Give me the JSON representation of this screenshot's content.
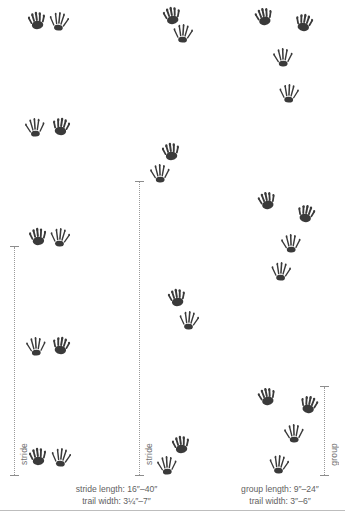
{
  "figure": {
    "background": "#ffffff",
    "ink_color": "#3a3a3a",
    "rule_color": "#9a9a9a",
    "text_color": "#5f5f5f"
  },
  "patterns": [
    {
      "id": "left-walk",
      "measure_label": "stride",
      "caption_lines": [
        "stride length: 16″–40″",
        "trail width: 3¼″–7″"
      ],
      "measure": {
        "x": 10,
        "top": 243,
        "bottom": 479
      },
      "caption": {
        "x": 44,
        "y": 483,
        "width": 145
      },
      "tracks": [
        {
          "name": "track-front",
          "type": "front",
          "x": 26,
          "y": 10,
          "rot": -8,
          "size": 22
        },
        {
          "name": "track-hind",
          "type": "hind",
          "x": 48,
          "y": 11,
          "rot": 6,
          "size": 22
        },
        {
          "name": "track-hind",
          "type": "hind",
          "x": 24,
          "y": 117,
          "rot": -4,
          "size": 22
        },
        {
          "name": "track-front",
          "type": "front",
          "x": 50,
          "y": 116,
          "rot": 8,
          "size": 22
        },
        {
          "name": "track-front",
          "type": "front",
          "x": 27,
          "y": 226,
          "rot": -6,
          "size": 22
        },
        {
          "name": "track-hind",
          "type": "hind",
          "x": 49,
          "y": 227,
          "rot": 5,
          "size": 22
        },
        {
          "name": "track-hind",
          "type": "hind",
          "x": 25,
          "y": 336,
          "rot": -3,
          "size": 22
        },
        {
          "name": "track-front",
          "type": "front",
          "x": 50,
          "y": 335,
          "rot": 9,
          "size": 22
        },
        {
          "name": "track-front",
          "type": "front",
          "x": 27,
          "y": 446,
          "rot": -7,
          "size": 22
        },
        {
          "name": "track-hind",
          "type": "hind",
          "x": 50,
          "y": 447,
          "rot": 6,
          "size": 22
        }
      ]
    },
    {
      "id": "middle-walk",
      "measure_label": "stride",
      "measure": {
        "x": 135,
        "top": 178,
        "bottom": 479
      },
      "tracks": [
        {
          "name": "track-front",
          "type": "front",
          "x": 161,
          "y": 5,
          "rot": -10,
          "size": 22
        },
        {
          "name": "track-hind",
          "type": "hind",
          "x": 172,
          "y": 23,
          "rot": 4,
          "size": 22
        },
        {
          "name": "track-front",
          "type": "front",
          "x": 160,
          "y": 141,
          "rot": -8,
          "size": 22
        },
        {
          "name": "track-hind",
          "type": "hind",
          "x": 149,
          "y": 163,
          "rot": -2,
          "size": 22
        },
        {
          "name": "track-front",
          "type": "front",
          "x": 166,
          "y": 287,
          "rot": -9,
          "size": 22
        },
        {
          "name": "track-hind",
          "type": "hind",
          "x": 178,
          "y": 310,
          "rot": 5,
          "size": 22
        },
        {
          "name": "track-front",
          "type": "front",
          "x": 170,
          "y": 434,
          "rot": -8,
          "size": 22
        },
        {
          "name": "track-hind",
          "type": "hind",
          "x": 156,
          "y": 455,
          "rot": -3,
          "size": 22
        }
      ]
    },
    {
      "id": "right-bound",
      "measure_label": "group",
      "caption_lines": [
        "group length: 9″–24″",
        "trail width: 3″–6″"
      ],
      "measure": {
        "x": 320,
        "top": 383,
        "bottom": 479
      },
      "caption": {
        "x": 218,
        "y": 483,
        "width": 124
      },
      "tracks": [
        {
          "name": "track-front",
          "type": "front",
          "x": 253,
          "y": 6,
          "rot": -12,
          "size": 22
        },
        {
          "name": "track-front",
          "type": "front",
          "x": 293,
          "y": 12,
          "rot": 10,
          "size": 22
        },
        {
          "name": "track-hind",
          "type": "hind",
          "x": 272,
          "y": 47,
          "rot": -2,
          "size": 22
        },
        {
          "name": "track-hind",
          "type": "hind",
          "x": 278,
          "y": 83,
          "rot": 3,
          "size": 22
        },
        {
          "name": "track-front",
          "type": "front",
          "x": 256,
          "y": 190,
          "rot": -12,
          "size": 22
        },
        {
          "name": "track-front",
          "type": "front",
          "x": 295,
          "y": 203,
          "rot": 11,
          "size": 22
        },
        {
          "name": "track-hind",
          "type": "hind",
          "x": 280,
          "y": 233,
          "rot": -2,
          "size": 22
        },
        {
          "name": "track-hind",
          "type": "hind",
          "x": 270,
          "y": 261,
          "rot": 4,
          "size": 22
        },
        {
          "name": "track-front",
          "type": "front",
          "x": 256,
          "y": 386,
          "rot": -12,
          "size": 22
        },
        {
          "name": "track-front",
          "type": "front",
          "x": 298,
          "y": 394,
          "rot": 12,
          "size": 22
        },
        {
          "name": "track-hind",
          "type": "hind",
          "x": 283,
          "y": 423,
          "rot": -2,
          "size": 22
        },
        {
          "name": "track-hind",
          "type": "hind",
          "x": 268,
          "y": 454,
          "rot": 5,
          "size": 22
        }
      ]
    }
  ]
}
